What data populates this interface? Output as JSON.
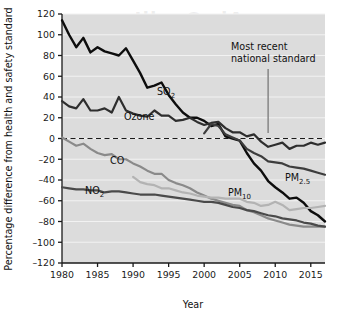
{
  "figure": {
    "background_color": "#ffffff",
    "plot_background_color": "#dcdcdc",
    "gridline_color": "#f2f2f2",
    "axis_color": "#1a1a1a"
  },
  "axes": {
    "ylabel": "Percentage difference from health and safety standard",
    "xlabel": "Year",
    "y_ticks": [
      "120",
      "100",
      "80",
      "60",
      "40",
      "20",
      "0",
      "-20",
      "-40",
      "-60",
      "-80",
      "-100",
      "-120"
    ],
    "x_ticks": [
      "1980",
      "1985",
      "1990",
      "1995",
      "2000",
      "2005",
      "2010",
      "2015"
    ]
  },
  "annotation": {
    "line1": "Most recent",
    "line2": "national standard",
    "pointer_color": "#8c8c8c"
  },
  "series_labels": {
    "so2": "SO",
    "so2_sub": "2",
    "ozone": "Ozone",
    "co": "CO",
    "no2": "NO",
    "no2_sub": "2",
    "pm10": "PM",
    "pm10_sub": "10",
    "pm25": "PM",
    "pm25_sub": "2.5"
  },
  "chart_data": {
    "type": "line",
    "title": "",
    "xlabel": "Year",
    "ylabel": "Percentage difference from health and safety standard",
    "xlim": [
      1980,
      2017
    ],
    "ylim": [
      -120,
      120
    ],
    "ytick_step": 20,
    "xtick_step": 5,
    "grid": "horizontal",
    "legend": "inline-labels",
    "zero_reference_line": {
      "value": 0,
      "style": "dashed",
      "label": "health and safety standard"
    },
    "annotations": [
      {
        "text": "Most recent national standard",
        "points_to_year": 2009,
        "points_to_value": -4
      }
    ],
    "x": [
      1980,
      1981,
      1982,
      1983,
      1984,
      1985,
      1986,
      1987,
      1988,
      1989,
      1990,
      1991,
      1992,
      1993,
      1994,
      1995,
      1996,
      1997,
      1998,
      1999,
      2000,
      2001,
      2002,
      2003,
      2004,
      2005,
      2006,
      2007,
      2008,
      2009,
      2010,
      2011,
      2012,
      2013,
      2014,
      2015,
      2016,
      2017
    ],
    "series": [
      {
        "name": "SO2",
        "color": "#0d0d0d",
        "width": 2.4,
        "values": [
          114,
          100,
          88,
          97,
          83,
          88,
          84,
          82,
          80,
          87,
          75,
          63,
          49,
          51,
          54,
          42,
          33,
          25,
          20,
          20,
          17,
          12,
          14,
          2,
          0,
          -2,
          -14,
          -24,
          -31,
          -41,
          -47,
          -52,
          -58,
          -57,
          -62,
          -70,
          -74,
          -80
        ]
      },
      {
        "name": "Ozone",
        "color": "#2e2e2e",
        "width": 2.2,
        "values": [
          36,
          31,
          29,
          38,
          27,
          27,
          29,
          25,
          40,
          27,
          24,
          22,
          21,
          27,
          22,
          22,
          17,
          18,
          20,
          16,
          13,
          15,
          16,
          10,
          6,
          6,
          2,
          4,
          -3,
          -8,
          -6,
          -4,
          -10,
          -7,
          -7,
          -4,
          -6,
          -4
        ]
      },
      {
        "name": "CO",
        "color": "#8a8a8a",
        "width": 2.2,
        "values": [
          1,
          -3,
          -7,
          -5,
          -10,
          -14,
          -16,
          -15,
          -20,
          -20,
          -24,
          -27,
          -31,
          -34,
          -34,
          -40,
          -43,
          -45,
          -48,
          -52,
          -55,
          -58,
          -60,
          -62,
          -64,
          -65,
          -69,
          -71,
          -74,
          -77,
          -79,
          -81,
          -83,
          -84,
          -85,
          -85,
          -85,
          -85
        ]
      },
      {
        "name": "NO2",
        "color": "#4a4a4a",
        "width": 2.2,
        "values": [
          -47,
          -48,
          -49,
          -49,
          -50,
          -50,
          -52,
          -51,
          -51,
          -52,
          -53,
          -54,
          -54,
          -54,
          -55,
          -56,
          -57,
          -58,
          -59,
          -60,
          -61,
          -61,
          -62,
          -64,
          -66,
          -67,
          -69,
          -70,
          -72,
          -74,
          -75,
          -77,
          -78,
          -79,
          -81,
          -82,
          -84,
          -85
        ]
      },
      {
        "name": "PM10",
        "color": "#b3b3b3",
        "width": 2.2,
        "values": [
          null,
          null,
          null,
          null,
          null,
          null,
          null,
          null,
          null,
          null,
          -37,
          -42,
          -44,
          -45,
          -48,
          -48,
          -50,
          -52,
          -53,
          -55,
          -56,
          -57,
          -57,
          -58,
          -58,
          -58,
          -61,
          -62,
          -65,
          -64,
          -61,
          -64,
          -69,
          -68,
          -67,
          -67,
          -66,
          -65
        ]
      },
      {
        "name": "PM2.5",
        "color": "#3d3d3d",
        "width": 2.2,
        "values": [
          null,
          null,
          null,
          null,
          null,
          null,
          null,
          null,
          null,
          null,
          null,
          null,
          null,
          null,
          null,
          null,
          null,
          null,
          null,
          null,
          5,
          14,
          12,
          4,
          1,
          -2,
          -10,
          -14,
          -17,
          -22,
          -23,
          -24,
          -27,
          -28,
          -29,
          -31,
          -33,
          -35
        ]
      }
    ]
  }
}
